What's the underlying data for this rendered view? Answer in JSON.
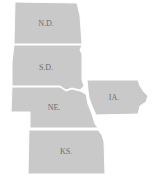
{
  "map": {
    "region": "Midwest states",
    "colors": {
      "fill": "#c9c9c9",
      "border": "#ffffff",
      "label": "#6e6e6e",
      "background": "#ffffff"
    },
    "states": [
      {
        "id": "nd",
        "label": "N.D.",
        "label_x": 46,
        "label_y": 24
      },
      {
        "id": "sd",
        "label": "S.D.",
        "label_x": 46,
        "label_y": 68
      },
      {
        "id": "ne",
        "label": "NE.",
        "label_x": 54,
        "label_y": 108
      },
      {
        "id": "ia",
        "label": "IA.",
        "label_x": 114,
        "label_y": 98
      },
      {
        "id": "ks",
        "label": "KS.",
        "label_x": 66,
        "label_y": 152
      }
    ]
  }
}
